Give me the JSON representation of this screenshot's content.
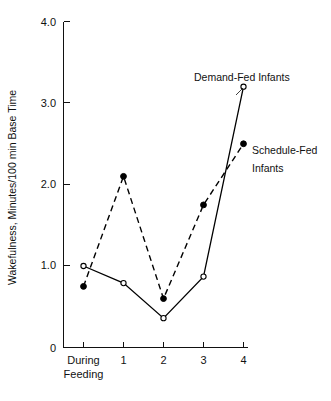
{
  "top_caption": "",
  "chart_data": {
    "type": "line",
    "title": "",
    "xlabel": "",
    "ylabel": "Wakefulness, Minutes/100 min Base Time",
    "categories": [
      "During Feeding",
      "1",
      "2",
      "3",
      "4"
    ],
    "x_tick_labels": [
      "During",
      "1",
      "2",
      "3",
      "4"
    ],
    "x_tick_label_second_line": "Feeding",
    "y_tick_labels": [
      "0",
      "1.0",
      "2.0",
      "3.0",
      "4.0"
    ],
    "y_tick_values": [
      0,
      1.0,
      2.0,
      3.0,
      4.0
    ],
    "ylim": [
      0,
      4.0
    ],
    "grid": false,
    "legend_position": "inline-annotations",
    "series": [
      {
        "name": "Demand-Fed Infants",
        "values": [
          1.0,
          0.79,
          0.36,
          0.87,
          3.2
        ],
        "line_style": "solid",
        "marker": "open-circle",
        "color": "#000000"
      },
      {
        "name": "Schedule-Fed Infants",
        "values": [
          0.75,
          2.1,
          0.6,
          1.75,
          2.5
        ],
        "line_style": "dashed",
        "marker": "filled-circle",
        "color": "#000000"
      }
    ],
    "annotations": [
      {
        "text": "Demand-Fed Infants",
        "series": "Demand-Fed Infants"
      },
      {
        "text": "Schedule-Fed",
        "series": "Schedule-Fed Infants"
      },
      {
        "text": "Infants",
        "series": "Schedule-Fed Infants"
      }
    ]
  }
}
